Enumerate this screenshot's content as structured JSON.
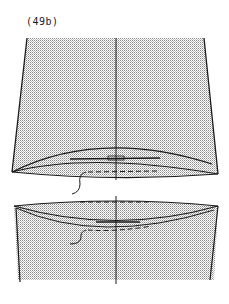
{
  "figure": {
    "label": "(49b)",
    "colors": {
      "line": "#1a1a1a",
      "fill_dot": "#8a8a8a",
      "background": "#ffffff"
    },
    "pieces": [
      {
        "name": "upper-piece",
        "shape": "tapered panel with convex lower edge and lens-shaped inner curves"
      },
      {
        "name": "lower-piece",
        "shape": "panel with convex upper edge and inner curve"
      }
    ],
    "annotations": [
      {
        "name": "stitch-line-upper",
        "style": "dashed"
      },
      {
        "name": "stitch-line-lower-top",
        "style": "dashed"
      },
      {
        "name": "stitch-line-lower-inner",
        "style": "dashed"
      }
    ]
  }
}
